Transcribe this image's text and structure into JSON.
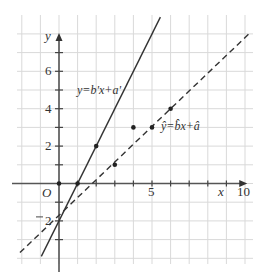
{
  "chart_data": {
    "type": "scatter",
    "title": "",
    "xlabel": "x",
    "ylabel": "y",
    "origin_label": "O",
    "xlim": [
      -2,
      10
    ],
    "ylim": [
      -4,
      8
    ],
    "grid": true,
    "x_ticks": [
      {
        "value": 5,
        "label": "5"
      },
      {
        "value": 10,
        "label": "10"
      }
    ],
    "y_ticks": [
      {
        "value": -2,
        "label": "-2"
      },
      {
        "value": 2,
        "label": "2"
      },
      {
        "value": 4,
        "label": "4"
      },
      {
        "value": 6,
        "label": "6"
      }
    ],
    "points": [
      {
        "x": 0,
        "y": 0
      },
      {
        "x": 1,
        "y": 0
      },
      {
        "x": 2,
        "y": 2
      },
      {
        "x": 3,
        "y": 1
      },
      {
        "x": 4,
        "y": 3
      },
      {
        "x": 5,
        "y": 3
      },
      {
        "x": 6,
        "y": 4
      }
    ],
    "series": [
      {
        "name": "y=b'x+a'",
        "style": "solid",
        "slope": 2,
        "intercept": -2,
        "x_range": [
          -0.95,
          5.45
        ]
      },
      {
        "name": "ŷ=b̂x+â",
        "style": "dashed",
        "slope": 0.95,
        "intercept": -1.7,
        "x_range": [
          -2.1,
          10.2
        ]
      }
    ],
    "annotations": [
      {
        "text_parts": [
          "y",
          "=",
          "b",
          "'",
          "x",
          "+",
          "a",
          "'"
        ],
        "label": "y=b'x+a'",
        "x": 0.35,
        "y": 4.9
      },
      {
        "label": "ŷ=b̂x+â",
        "x": 5.3,
        "y": 2.6
      }
    ]
  },
  "labels": {
    "x_axis": "x",
    "y_axis": "y",
    "origin": "O",
    "tick_x_5": "5",
    "tick_x_10": "10",
    "tick_y_6": "6",
    "tick_y_4": "4",
    "tick_y_2": "2",
    "tick_y_neg2": "2",
    "solid_line_label": "y=b'x+a'",
    "dashed_line_label": "ŷ=b̂x+â"
  }
}
